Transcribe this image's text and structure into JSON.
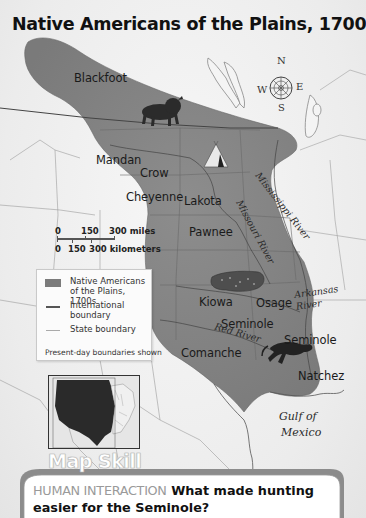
{
  "map": {
    "title": "Native Americans of the Plains, 1700s",
    "region_fill_color": "#8a8a8a",
    "background_color": "#efefef",
    "tribes": [
      {
        "name": "Blackfoot",
        "x": 74,
        "y": 71
      },
      {
        "name": "Mandan",
        "x": 96,
        "y": 153
      },
      {
        "name": "Crow",
        "x": 140,
        "y": 166
      },
      {
        "name": "Cheyenne",
        "x": 126,
        "y": 190
      },
      {
        "name": "Lakota",
        "x": 184,
        "y": 194
      },
      {
        "name": "Pawnee",
        "x": 189,
        "y": 225
      },
      {
        "name": "Kiowa",
        "x": 199,
        "y": 295
      },
      {
        "name": "Osage",
        "x": 256,
        "y": 296
      },
      {
        "name": "Seminole",
        "x": 221,
        "y": 317
      },
      {
        "name": "Seminole",
        "x": 284,
        "y": 333
      },
      {
        "name": "Comanche",
        "x": 181,
        "y": 346
      },
      {
        "name": "Natchez",
        "x": 298,
        "y": 369
      }
    ],
    "rivers": [
      {
        "name": "Mississippi River",
        "x": 272,
        "y": 168,
        "rotate": 52
      },
      {
        "name": "Missouri River",
        "x": 244,
        "y": 196,
        "rotate": 62
      },
      {
        "name": "Arkansas",
        "x": 294,
        "y": 290,
        "rotate": -8
      },
      {
        "name": "River",
        "x": 300,
        "y": 302,
        "rotate": -8
      },
      {
        "name": "Red River",
        "x": 216,
        "y": 335,
        "rotate": 16
      }
    ],
    "water_labels": [
      {
        "name": "Gulf of",
        "x": 279,
        "y": 413
      },
      {
        "name": "Mexico",
        "x": 281,
        "y": 430
      }
    ],
    "compass": {
      "n": "N",
      "e": "E",
      "s": "S",
      "w": "W"
    },
    "icons": [
      "bison-icon",
      "tipi-icon",
      "bison-hide-icon",
      "horse-icon"
    ]
  },
  "scale": {
    "miles": [
      "0",
      "150",
      "300 miles"
    ],
    "kilometers": [
      "0",
      "150",
      "300 kilometers"
    ]
  },
  "legend": {
    "items": [
      {
        "type": "area",
        "label": "Native Americans of the Plains, 1700s"
      },
      {
        "type": "international-boundary",
        "label": "International boundary"
      },
      {
        "type": "state-boundary",
        "label": "State boundary"
      }
    ],
    "note": "Present-day boundaries shown"
  },
  "map_skill": {
    "heading": "Map Skill",
    "category": "HUMAN INTERACTION",
    "question": "What made hunting easier for the Seminole?"
  }
}
